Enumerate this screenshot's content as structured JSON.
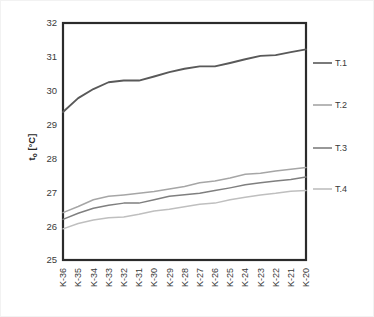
{
  "chart_data": {
    "type": "line",
    "title": "",
    "xlabel": "",
    "ylabel": "tₒ [°C]",
    "ylabel_base": "t",
    "ylabel_sub": "o",
    "ylabel_unit": " [°C]",
    "ylim": [
      25,
      32
    ],
    "yticks": [
      25,
      26,
      27,
      28,
      29,
      30,
      31,
      32
    ],
    "ytick_labels": [
      "25",
      "26",
      "27",
      "28",
      "29",
      "30",
      "31",
      "32"
    ],
    "grid": true,
    "legend_position": "right",
    "categories": [
      "K-36",
      "K-35",
      "K-34",
      "K-33",
      "K-32",
      "K-31",
      "K-30",
      "K-29",
      "K-28",
      "K-27",
      "K-26",
      "K-25",
      "K-24",
      "K-23",
      "K-22",
      "K-21",
      "K-20"
    ],
    "series": [
      {
        "name": "T.1",
        "color": "#595959",
        "width": 1.9,
        "values": [
          29.37,
          29.78,
          30.05,
          30.25,
          30.3,
          30.3,
          30.42,
          30.55,
          30.65,
          30.72,
          30.72,
          30.82,
          30.93,
          31.03,
          31.05,
          31.14,
          31.22
        ]
      },
      {
        "name": "T.2",
        "color": "#a6a6a6",
        "width": 1.5,
        "values": [
          26.4,
          26.58,
          26.78,
          26.88,
          26.92,
          26.97,
          27.02,
          27.1,
          27.17,
          27.28,
          27.33,
          27.42,
          27.53,
          27.56,
          27.63,
          27.68,
          27.73
        ]
      },
      {
        "name": "T.3",
        "color": "#7f7f7f",
        "width": 1.5,
        "values": [
          26.2,
          26.38,
          26.53,
          26.62,
          26.68,
          26.68,
          26.78,
          26.88,
          26.93,
          26.97,
          27.05,
          27.13,
          27.22,
          27.28,
          27.33,
          27.38,
          27.45
        ]
      },
      {
        "name": "T.4",
        "color": "#bfbfbf",
        "width": 1.5,
        "values": [
          25.92,
          26.08,
          26.18,
          26.25,
          26.27,
          26.35,
          26.45,
          26.5,
          26.57,
          26.65,
          26.68,
          26.78,
          26.85,
          26.92,
          26.97,
          27.03,
          27.05
        ]
      }
    ]
  },
  "legend": {
    "items": [
      {
        "label": "T.1"
      },
      {
        "label": "T.2"
      },
      {
        "label": "T.3"
      },
      {
        "label": "T.4"
      }
    ]
  }
}
